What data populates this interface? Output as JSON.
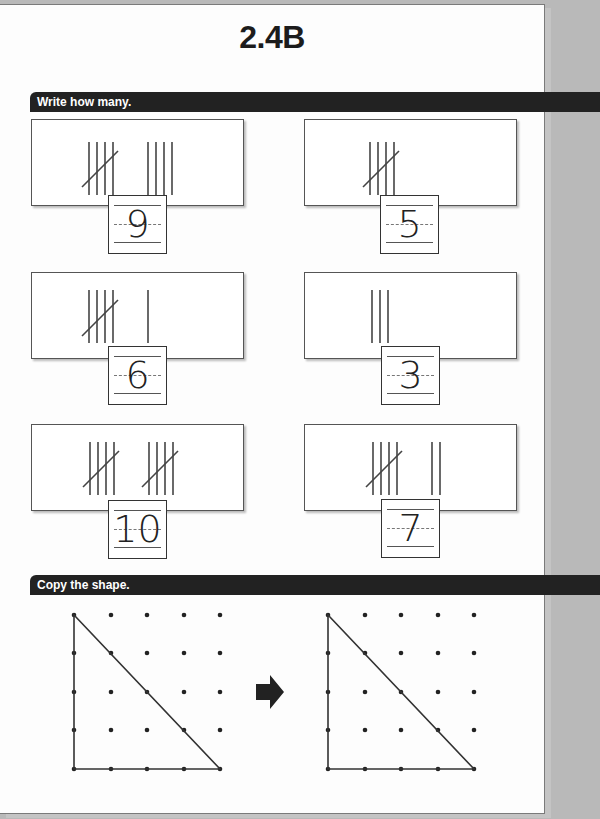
{
  "page": {
    "title": "2.4B"
  },
  "sections": [
    {
      "label": "Write how many."
    },
    {
      "label": "Copy the shape."
    }
  ],
  "tally_items": [
    {
      "groups_of_five": 1,
      "extra": 4,
      "answer": "9"
    },
    {
      "groups_of_five": 1,
      "extra": 0,
      "answer": "5"
    },
    {
      "groups_of_five": 1,
      "extra": 1,
      "answer": "6"
    },
    {
      "groups_of_five": 0,
      "extra": 3,
      "answer": "3"
    },
    {
      "groups_of_five": 2,
      "extra": 0,
      "answer": "10"
    },
    {
      "groups_of_five": 1,
      "extra": 2,
      "answer": "7"
    }
  ],
  "copy_shape": {
    "grid": {
      "rows": 5,
      "cols": 5
    },
    "shape": "right-triangle",
    "vertices": [
      [
        0,
        0
      ],
      [
        0,
        4
      ],
      [
        4,
        4
      ]
    ],
    "arrow_icon": "right-arrow"
  }
}
